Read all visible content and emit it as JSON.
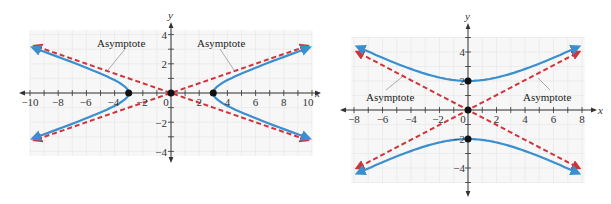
{
  "chart_data": [
    {
      "type": "line",
      "title": "",
      "description": "Horizontal hyperbola x^2/9 - y^2/1 = 1 with asymptotes y = ±x/3",
      "xlabel": "x",
      "ylabel": "y",
      "xlim": [
        -10,
        10
      ],
      "ylim": [
        -4,
        4
      ],
      "grid": true,
      "x_tick_labels": [
        "−10",
        "−8",
        "−6",
        "−4",
        "−2",
        "0",
        "2",
        "4",
        "6",
        "8",
        "10"
      ],
      "x_ticks": [
        -10,
        -8,
        -6,
        -4,
        -2,
        0,
        2,
        4,
        6,
        8,
        10
      ],
      "y_tick_labels": [
        "4",
        "2",
        "−2",
        "−4"
      ],
      "y_ticks": [
        4,
        2,
        -2,
        -4
      ],
      "series": [
        {
          "name": "Hyperbola",
          "style": "solid",
          "color": "#3a8fd0",
          "equation": "x^2/9 - y^2 = 1",
          "vertices": [
            [
              -3,
              0
            ],
            [
              3,
              0
            ]
          ]
        },
        {
          "name": "Asymptote",
          "style": "dashed",
          "color": "#d0343a",
          "equation": "y = x/3",
          "points": [
            [
              -9.5,
              -3.17
            ],
            [
              9.5,
              3.17
            ]
          ]
        },
        {
          "name": "Asymptote",
          "style": "dashed",
          "color": "#d0343a",
          "equation": "y = -x/3",
          "points": [
            [
              -9.5,
              3.17
            ],
            [
              9.5,
              -3.17
            ]
          ]
        }
      ],
      "points": [
        [
          -3,
          0
        ],
        [
          0,
          0
        ],
        [
          3,
          0
        ]
      ],
      "annotations": [
        {
          "text": "Asymptote",
          "target": "y = -x/3"
        },
        {
          "text": "Asymptote",
          "target": "y = x/3"
        }
      ]
    },
    {
      "type": "line",
      "title": "",
      "description": "Vertical hyperbola y^2/4 - x^2/16 = 1 with asymptotes y = ±x/2",
      "xlabel": "x",
      "ylabel": "y",
      "xlim": [
        -8,
        8
      ],
      "ylim": [
        -5,
        5
      ],
      "grid": true,
      "x_tick_labels": [
        "−8",
        "−6",
        "−4",
        "−2",
        "0",
        "2",
        "4",
        "6",
        "8"
      ],
      "x_ticks": [
        -8,
        -6,
        -4,
        -2,
        0,
        2,
        4,
        6,
        8
      ],
      "y_tick_labels": [
        "4",
        "2",
        "−2",
        "−4"
      ],
      "y_ticks": [
        4,
        2,
        -2,
        -4
      ],
      "series": [
        {
          "name": "Hyperbola",
          "style": "solid",
          "color": "#3a8fd0",
          "equation": "y^2/4 - x^2/16 = 1",
          "vertices": [
            [
              0,
              2
            ],
            [
              0,
              -2
            ]
          ]
        },
        {
          "name": "Asymptote",
          "style": "dashed",
          "color": "#d0343a",
          "equation": "y = x/2",
          "points": [
            [
              -7.6,
              -3.8
            ],
            [
              7.6,
              3.8
            ]
          ]
        },
        {
          "name": "Asymptote",
          "style": "dashed",
          "color": "#d0343a",
          "equation": "y = -x/2",
          "points": [
            [
              -7.6,
              3.8
            ],
            [
              7.6,
              -3.8
            ]
          ]
        }
      ],
      "points": [
        [
          0,
          2
        ],
        [
          0,
          0
        ],
        [
          0,
          -2
        ]
      ],
      "annotations": [
        {
          "text": "Asymptote",
          "target": "y = -x/2"
        },
        {
          "text": "Asymptote",
          "target": "y = x/2"
        }
      ]
    }
  ],
  "labels": {
    "x_axis": "x",
    "y_axis": "y",
    "asymptote": "Asymptote",
    "left_x_ticks": [
      "−10",
      "−8",
      "−6",
      "−4",
      "−2",
      "0",
      "2",
      "4",
      "6",
      "8",
      "10"
    ],
    "left_y_ticks": [
      "4",
      "2",
      "−2",
      "−4"
    ],
    "right_x_ticks": [
      "−8",
      "−6",
      "−4",
      "−2",
      "0",
      "2",
      "4",
      "6",
      "8"
    ],
    "right_y_ticks": [
      "4",
      "2",
      "−2",
      "−4"
    ]
  },
  "colors": {
    "hyperbola": "#3a8fd0",
    "asymptote": "#d0343a",
    "axis": "#333333",
    "grid": "#e4e4e4",
    "point": "#111111"
  }
}
